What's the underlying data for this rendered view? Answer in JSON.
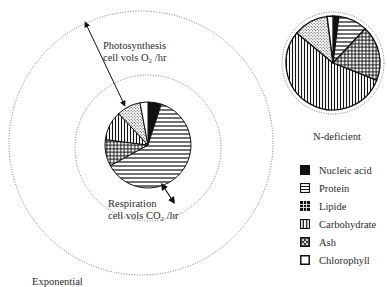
{
  "labels": {
    "photosynthesis_line1": "Photosynthesis",
    "photosynthesis_line2": "cell vols O₂ /hr",
    "respiration_line1": "Respiration",
    "respiration_line2": "cell vols CO₂ /hr",
    "exponential": "Exponential",
    "n_deficient": "N-deficient"
  },
  "legend": [
    {
      "name": "Nucleic acid",
      "pattern": "solid-black"
    },
    {
      "name": "Protein",
      "pattern": "horizontal-lines"
    },
    {
      "name": "Lipide",
      "pattern": "crosshatch"
    },
    {
      "name": "Carbohydrate",
      "pattern": "vertical-lines"
    },
    {
      "name": "Ash",
      "pattern": "stipple"
    },
    {
      "name": "Chlorophyll",
      "pattern": "white"
    }
  ],
  "pies": {
    "exponential": {
      "slices_pct": {
        "Nucleic acid": 5,
        "Protein": 62,
        "Lipide": 10,
        "Carbohydrate": 11,
        "Ash": 9,
        "Chlorophyll": 3
      }
    },
    "n_deficient": {
      "slices_pct": {
        "Nucleic acid": 2,
        "Protein": 10,
        "Lipide": 19,
        "Carbohydrate": 55,
        "Ash": 12,
        "Chlorophyll": 2
      }
    }
  }
}
